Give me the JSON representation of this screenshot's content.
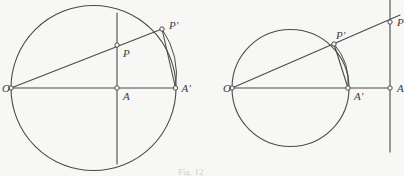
{
  "figure": {
    "caption": "Fig. 12",
    "background_color": "#f7f7f5",
    "stroke_color": "#4a4a4a",
    "label_color": "#3c3c3c",
    "node_fill_color": "#f7f7f5",
    "width": 404,
    "height": 176
  },
  "panels": [
    {
      "id": "left-panel",
      "name": "circle-inversion-diagram-left",
      "circle": {
        "cx": 93.5,
        "cy": 88,
        "r": 82.5
      },
      "points": [
        {
          "key": "O",
          "label": "O",
          "x": 11,
          "y": 88,
          "label_dx": -9,
          "label_dy": 1,
          "node": true
        },
        {
          "key": "A",
          "label": "A",
          "x": 117,
          "y": 88,
          "label_dx": 6,
          "label_dy": 9,
          "node": true
        },
        {
          "key": "Aprime",
          "label": "A'",
          "x": 175.5,
          "y": 88,
          "label_dx": 6,
          "label_dy": 1,
          "node": true
        },
        {
          "key": "P",
          "label": "P",
          "x": 117,
          "y": 45,
          "label_dx": 6,
          "label_dy": 9,
          "node": true
        },
        {
          "key": "Pprime",
          "label": "P'",
          "x": 162,
          "y": 29,
          "label_dx": 7,
          "label_dy": -3,
          "node": true
        }
      ],
      "segments": [
        {
          "name": "diameter-O-Aprime",
          "x1": 11,
          "y1": 88,
          "x2": 176,
          "y2": 88
        },
        {
          "name": "ray-O-through-Pprime",
          "x1": 11,
          "y1": 88,
          "x2": 162,
          "y2": 29
        },
        {
          "name": "vertical-line-at-A",
          "x1": 117,
          "y1": 13,
          "x2": 117,
          "y2": 164
        },
        {
          "name": "chord-Pprime-Aprime",
          "x1": 162,
          "y1": 29,
          "x2": 175.5,
          "y2": 88
        }
      ],
      "arcs": [
        {
          "name": "arc-Pprime-to-Aprime",
          "x1": 162,
          "y1": 29,
          "x2": 175.5,
          "y2": 88,
          "rx": 82.5,
          "ry": 82.5,
          "large": 0,
          "sweep": 1
        }
      ]
    },
    {
      "id": "right-panel",
      "name": "circle-inversion-diagram-right",
      "circle": {
        "cx": 290.5,
        "cy": 88,
        "r": 58.5
      },
      "points": [
        {
          "key": "O",
          "label": "O",
          "x": 232,
          "y": 88,
          "label_dx": -9,
          "label_dy": 1,
          "node": true
        },
        {
          "key": "Aprime",
          "label": "A'",
          "x": 348,
          "y": 88,
          "label_dx": 6,
          "label_dy": 9,
          "node": true
        },
        {
          "key": "A",
          "label": "A",
          "x": 390,
          "y": 88,
          "label_dx": 7,
          "label_dy": 1,
          "node": true
        },
        {
          "key": "Pprime",
          "label": "P'",
          "x": 334,
          "y": 44,
          "label_dx": 2,
          "label_dy": -8,
          "node": true
        },
        {
          "key": "P",
          "label": "P",
          "x": 390,
          "y": 22,
          "label_dx": 7,
          "label_dy": 1,
          "node": true
        }
      ],
      "segments": [
        {
          "name": "diameter-O-A",
          "x1": 232,
          "y1": 88,
          "x2": 390,
          "y2": 88
        },
        {
          "name": "ray-O-through-P",
          "x1": 232,
          "y1": 88,
          "x2": 400,
          "y2": 15
        },
        {
          "name": "vertical-line-at-A",
          "x1": 390,
          "y1": 0,
          "x2": 390,
          "y2": 152
        },
        {
          "name": "chord-Pprime-Aprime",
          "x1": 334,
          "y1": 44,
          "x2": 348,
          "y2": 88
        }
      ],
      "arcs": [
        {
          "name": "arc-Pprime-to-Aprime",
          "x1": 334,
          "y1": 44,
          "x2": 348,
          "y2": 88,
          "rx": 58.5,
          "ry": 58.5,
          "large": 0,
          "sweep": 1
        }
      ]
    }
  ]
}
